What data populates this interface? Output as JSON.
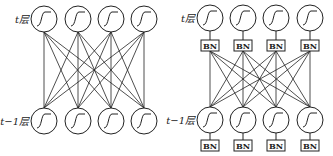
{
  "left_diagram": {
    "top_label": "t层",
    "bottom_label": "t−1层",
    "neurons_per_layer": 4,
    "activation_icon": "sigmoid-curve"
  },
  "right_diagram": {
    "top_label": "t层",
    "bottom_label": "t−1层",
    "neurons_per_layer": 4,
    "activation_icon": "sigmoid-curve",
    "bn_label": "BN"
  },
  "colors": {
    "stroke": "#222222",
    "background": "#ffffff"
  }
}
